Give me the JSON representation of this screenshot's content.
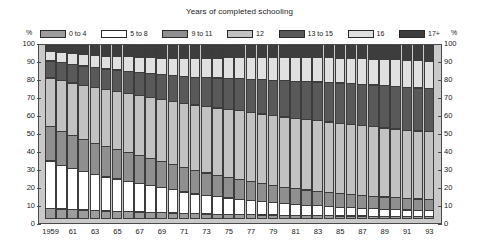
{
  "chart_data": {
    "type": "bar",
    "subtype": "stacked-percentage-column",
    "title": "Years of completed schooling",
    "xlabel": "",
    "ylabel": "%",
    "ylim": [
      0,
      100
    ],
    "yticks": [
      0,
      10,
      20,
      30,
      40,
      50,
      60,
      70,
      80,
      90,
      100
    ],
    "grid": false,
    "legend_position": "top",
    "axis_unit_left": "%",
    "axis_unit_right": "%",
    "categories": [
      "1959",
      "60",
      "61",
      "62",
      "63",
      "64",
      "65",
      "66",
      "67",
      "68",
      "69",
      "70",
      "71",
      "72",
      "73",
      "74",
      "75",
      "76",
      "77",
      "78",
      "79",
      "80",
      "81",
      "82",
      "83",
      "84",
      "85",
      "86",
      "87",
      "88",
      "89",
      "90",
      "91",
      "92",
      "93"
    ],
    "tick_labels": [
      "1959",
      "",
      "61",
      "",
      "63",
      "",
      "65",
      "",
      "67",
      "",
      "69",
      "",
      "71",
      "",
      "73",
      "",
      "75",
      "",
      "77",
      "",
      "79",
      "",
      "81",
      "",
      "83",
      "",
      "85",
      "",
      "87",
      "",
      "89",
      "",
      "91",
      "",
      "93"
    ],
    "series": [
      {
        "name": "0 to 4",
        "color": "#9c9c9c",
        "values": [
          6.0,
          5.7,
          5.4,
          5.1,
          4.9,
          4.6,
          4.4,
          4.2,
          4.0,
          3.8,
          3.6,
          3.4,
          3.2,
          3.1,
          2.9,
          2.8,
          2.7,
          2.6,
          2.5,
          2.4,
          2.3,
          2.2,
          2.1,
          2.0,
          2.0,
          1.9,
          1.8,
          1.8,
          1.7,
          1.7,
          1.6,
          1.6,
          1.5,
          1.5,
          1.5
        ]
      },
      {
        "name": "5 to 8",
        "color": "#ffffff",
        "values": [
          27.0,
          25.0,
          23.5,
          22.0,
          20.5,
          19.5,
          18.5,
          17.5,
          16.5,
          15.5,
          14.5,
          13.5,
          12.5,
          11.5,
          10.8,
          10.2,
          9.6,
          9.0,
          8.4,
          7.9,
          7.4,
          7.0,
          6.6,
          6.2,
          5.9,
          5.6,
          5.3,
          5.0,
          4.8,
          4.6,
          4.4,
          4.2,
          4.0,
          3.9,
          3.8
        ]
      },
      {
        "name": "9 to 11",
        "color": "#8f8f8f",
        "values": [
          20.0,
          19.5,
          19.0,
          18.5,
          18.0,
          17.5,
          17.0,
          16.5,
          16.0,
          15.5,
          15.0,
          14.5,
          14.0,
          13.5,
          13.0,
          12.5,
          12.0,
          11.5,
          11.0,
          10.5,
          10.0,
          9.5,
          9.2,
          8.9,
          8.6,
          8.3,
          8.0,
          7.8,
          7.6,
          7.4,
          7.2,
          7.0,
          6.8,
          6.7,
          6.6
        ]
      },
      {
        "name": "12",
        "color": "#c2c2c2",
        "values": [
          27.5,
          28.8,
          29.8,
          30.8,
          31.6,
          32.3,
          33.0,
          33.6,
          34.2,
          34.8,
          35.4,
          36.0,
          36.6,
          37.2,
          37.8,
          38.2,
          38.6,
          39.0,
          39.3,
          39.5,
          39.7,
          39.8,
          39.9,
          40.0,
          40.0,
          40.0,
          39.9,
          39.8,
          39.6,
          39.4,
          39.2,
          39.0,
          38.8,
          38.6,
          38.4
        ]
      },
      {
        "name": "13 to 15",
        "color": "#595959",
        "values": [
          10.0,
          10.4,
          10.8,
          11.2,
          11.6,
          12.0,
          12.4,
          12.8,
          13.2,
          13.7,
          14.2,
          14.8,
          15.4,
          16.0,
          16.6,
          17.2,
          17.8,
          18.4,
          19.0,
          19.6,
          20.2,
          20.8,
          21.3,
          21.8,
          22.2,
          22.6,
          23.0,
          23.3,
          23.6,
          23.9,
          24.1,
          24.3,
          24.5,
          24.6,
          24.7
        ]
      },
      {
        "name": "16",
        "color": "#e0e0e0",
        "values": [
          6.0,
          6.3,
          6.6,
          7.0,
          7.4,
          7.8,
          8.2,
          8.6,
          9.0,
          9.4,
          9.8,
          10.2,
          10.6,
          11.0,
          11.3,
          11.6,
          11.9,
          12.2,
          12.5,
          12.8,
          13.1,
          13.4,
          13.6,
          13.8,
          14.0,
          14.2,
          14.4,
          14.6,
          14.8,
          15.0,
          15.2,
          15.4,
          15.6,
          15.7,
          15.8
        ]
      },
      {
        "name": "17+",
        "color": "#3d3d3d",
        "values": [
          3.5,
          4.3,
          4.9,
          5.4,
          6.0,
          6.3,
          6.5,
          6.8,
          7.1,
          7.3,
          7.5,
          7.6,
          7.7,
          7.7,
          7.6,
          7.5,
          7.4,
          7.3,
          7.3,
          7.3,
          7.3,
          7.3,
          7.3,
          7.3,
          7.3,
          7.4,
          7.6,
          7.7,
          7.9,
          8.0,
          8.3,
          8.5,
          8.8,
          9.0,
          9.2
        ]
      }
    ]
  },
  "legend": {
    "items": [
      {
        "label": "0 to 4",
        "color": "#9c9c9c"
      },
      {
        "label": "5 to 8",
        "color": "#ffffff"
      },
      {
        "label": "9 to 11",
        "color": "#8f8f8f"
      },
      {
        "label": "12",
        "color": "#c2c2c2"
      },
      {
        "label": "13 to 15",
        "color": "#595959"
      },
      {
        "label": "16",
        "color": "#e0e0e0"
      },
      {
        "label": "17+",
        "color": "#3d3d3d"
      }
    ]
  },
  "axes": {
    "left_unit": "%",
    "right_unit": "%",
    "yticks": [
      "100",
      "90",
      "80",
      "70",
      "60",
      "50",
      "40",
      "30",
      "20",
      "10",
      "0"
    ]
  }
}
